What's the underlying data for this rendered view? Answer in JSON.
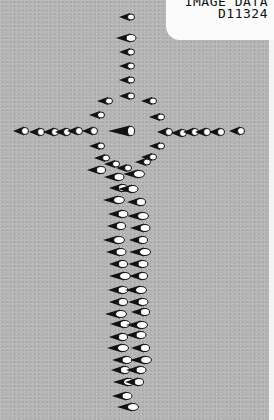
{
  "image": {
    "description": "Grayscale aerial-style photograph of stones arranged on gravel forming a Christian cross with a ring around the intersection",
    "background_color": "#b4b4b4",
    "stone_fill": "#ffffff",
    "stone_shadow": "#111111"
  },
  "label": {
    "line1": "IMAGE DATA",
    "line2": "D11324"
  },
  "stones": {
    "top_arm": [
      [
        130,
        17
      ],
      [
        130,
        38
      ],
      [
        130,
        52
      ],
      [
        130,
        66
      ],
      [
        130,
        80
      ],
      [
        130,
        96
      ]
    ],
    "left_arm": [
      [
        24,
        131
      ],
      [
        40,
        132
      ],
      [
        54,
        132
      ],
      [
        66,
        132
      ],
      [
        78,
        131
      ],
      [
        93,
        131
      ]
    ],
    "right_arm": [
      [
        168,
        132
      ],
      [
        182,
        133
      ],
      [
        194,
        132
      ],
      [
        206,
        132
      ],
      [
        220,
        132
      ],
      [
        240,
        131
      ]
    ],
    "center": [
      [
        125,
        131
      ]
    ],
    "ring": [
      [
        108,
        101
      ],
      [
        152,
        101
      ],
      [
        100,
        115
      ],
      [
        160,
        117
      ],
      [
        100,
        146
      ],
      [
        160,
        146
      ],
      [
        105,
        158
      ],
      [
        152,
        157
      ],
      [
        115,
        164
      ],
      [
        146,
        162
      ],
      [
        127,
        168
      ]
    ],
    "shaft": [
      [
        100,
        170
      ],
      [
        118,
        177
      ],
      [
        138,
        174
      ],
      [
        122,
        188
      ],
      [
        132,
        189
      ],
      [
        118,
        200
      ],
      [
        140,
        202
      ],
      [
        122,
        214
      ],
      [
        142,
        216
      ],
      [
        120,
        226
      ],
      [
        144,
        228
      ],
      [
        118,
        240
      ],
      [
        142,
        240
      ],
      [
        120,
        252
      ],
      [
        144,
        252
      ],
      [
        122,
        264
      ],
      [
        142,
        264
      ],
      [
        124,
        276
      ],
      [
        142,
        276
      ],
      [
        122,
        290
      ],
      [
        140,
        290
      ],
      [
        122,
        302
      ],
      [
        142,
        302
      ],
      [
        120,
        314
      ],
      [
        144,
        312
      ],
      [
        124,
        324
      ],
      [
        141,
        325
      ],
      [
        122,
        337
      ],
      [
        140,
        335
      ],
      [
        122,
        348
      ],
      [
        144,
        348
      ],
      [
        126,
        360
      ],
      [
        145,
        360
      ],
      [
        124,
        370
      ],
      [
        140,
        370
      ],
      [
        128,
        382
      ],
      [
        138,
        382
      ],
      [
        126,
        396
      ],
      [
        132,
        407
      ]
    ]
  }
}
